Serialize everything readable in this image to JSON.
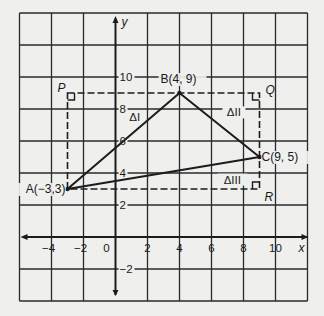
{
  "diagram": {
    "colors": {
      "background": "#efefed",
      "ink": "#1c1c1c",
      "grid": "#2a2a2a"
    },
    "axes": {
      "x_label": "x",
      "y_label": "y",
      "x_range": [
        -6,
        12
      ],
      "y_range": [
        -4,
        14
      ],
      "grid_step": 2,
      "x_tick_labels": [
        {
          "value": -4,
          "text": "−4"
        },
        {
          "value": -2,
          "text": "−2"
        },
        {
          "value": 0,
          "text": "0"
        },
        {
          "value": 2,
          "text": "2"
        },
        {
          "value": 4,
          "text": "4"
        },
        {
          "value": 6,
          "text": "6"
        },
        {
          "value": 8,
          "text": "8"
        },
        {
          "value": 10,
          "text": "10"
        }
      ],
      "y_tick_labels": [
        {
          "value": 10,
          "text": "10"
        },
        {
          "value": 8,
          "text": "8"
        },
        {
          "value": 6,
          "text": "6"
        },
        {
          "value": 4,
          "text": "4"
        },
        {
          "value": 2,
          "text": "2"
        },
        {
          "value": -2,
          "text": "−2"
        }
      ]
    },
    "points": [
      {
        "id": "A",
        "x": -3,
        "y": 3,
        "label": "A(−3,3)",
        "anchor": "end",
        "dx": -2,
        "dy": 4
      },
      {
        "id": "B",
        "x": 4,
        "y": 9,
        "label": "B(4, 9)",
        "anchor": "middle",
        "dx": -1,
        "dy": -10
      },
      {
        "id": "C",
        "x": 9,
        "y": 5,
        "label": "C(9, 5)",
        "anchor": "start",
        "dx": 2,
        "dy": 4
      }
    ],
    "corners": [
      {
        "id": "P",
        "x": -3,
        "y": 9,
        "label": "P",
        "dx": -10,
        "dy": -1,
        "mark": "right"
      },
      {
        "id": "Q",
        "x": 9,
        "y": 9,
        "label": "Q",
        "dx": 6,
        "dy": 1,
        "mark": "left"
      },
      {
        "id": "R",
        "x": 9,
        "y": 3,
        "label": "R",
        "dx": 5,
        "dy": 12,
        "mark": "leftUp"
      }
    ],
    "triangle": [
      "A",
      "B",
      "C"
    ],
    "rectangle": [
      "P",
      "Q",
      "R",
      "A"
    ],
    "regions": [
      {
        "label": "ΔI",
        "x": 1.2,
        "y": 7.3
      },
      {
        "label": "ΔII",
        "x": 7.4,
        "y": 7.6
      },
      {
        "label": "ΔIII",
        "x": 7.3,
        "y": 3.4
      }
    ]
  }
}
